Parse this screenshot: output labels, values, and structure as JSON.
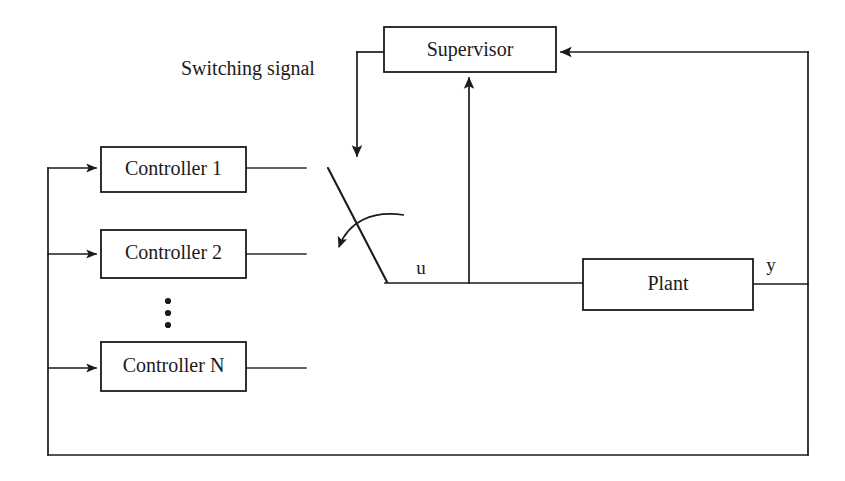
{
  "diagram": {
    "type": "block-diagram",
    "canvas": {
      "width": 845,
      "height": 481
    },
    "background_color": "#ffffff",
    "line_color": "#1b1b1b",
    "blocks": [
      {
        "id": "supervisor",
        "label": "Supervisor",
        "x": 384,
        "y": 27,
        "w": 172,
        "h": 45
      },
      {
        "id": "controller1",
        "label": "Controller 1",
        "x": 101,
        "y": 147,
        "w": 145,
        "h": 45
      },
      {
        "id": "controller2",
        "label": "Controller 2",
        "x": 101,
        "y": 230,
        "w": 145,
        "h": 48
      },
      {
        "id": "controllerN",
        "label": "Controller N",
        "x": 101,
        "y": 342,
        "w": 145,
        "h": 49
      },
      {
        "id": "plant",
        "label": "Plant",
        "x": 583,
        "y": 259,
        "w": 170,
        "h": 51
      }
    ],
    "annotations": [
      {
        "id": "switching-signal",
        "label": "Switching signal",
        "x": 181,
        "y": 70
      },
      {
        "id": "signal-u",
        "label": "u",
        "x": 421,
        "y": 270
      },
      {
        "id": "signal-y",
        "label": "y",
        "x": 771,
        "y": 267
      }
    ],
    "vertical_ellipsis": {
      "id": "controller-ellipsis",
      "x": 168,
      "dots_y": [
        301,
        313,
        325
      ]
    },
    "switch": {
      "id": "switching-element",
      "lever_from": {
        "x": 328,
        "y": 168
      },
      "lever_to": {
        "x": 387,
        "y": 282
      },
      "rotation_hint": "counter-clockwise curved arrow crossing lever"
    },
    "wires": [
      {
        "id": "supervisor-to-switch",
        "desc": "Supervisor left side out, down to switch lever top"
      },
      {
        "id": "plant-output-feedback",
        "desc": "Plant output y to right bus, up into Supervisor right side"
      },
      {
        "id": "u-to-supervisor",
        "desc": "Control signal u up into Supervisor bottom"
      },
      {
        "id": "u-to-plant",
        "desc": "Switch common node right to Plant input"
      },
      {
        "id": "y-bottom-feedback",
        "desc": "Right bus down to bottom rail, left to controller input bus"
      },
      {
        "id": "controller-input-bus",
        "desc": "Left vertical bus feeding all controller inputs"
      },
      {
        "id": "controller1-output",
        "desc": "Controller 1 output stub"
      },
      {
        "id": "controller2-output",
        "desc": "Controller 2 output stub"
      },
      {
        "id": "controllerN-output",
        "desc": "Controller N output stub"
      }
    ]
  }
}
